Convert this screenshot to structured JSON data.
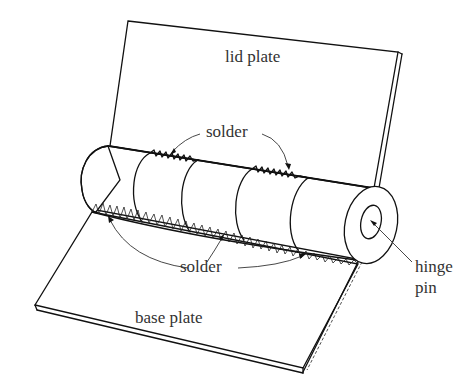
{
  "diagram": {
    "labels": {
      "lid_plate": "lid plate",
      "solder_top": "solder",
      "solder_bottom": "solder",
      "hinge_pin_line1": "hinge",
      "hinge_pin_line2": "pin",
      "base_plate": "base plate"
    },
    "colors": {
      "ink": "#111111",
      "text": "#333333",
      "background": "#ffffff"
    }
  }
}
